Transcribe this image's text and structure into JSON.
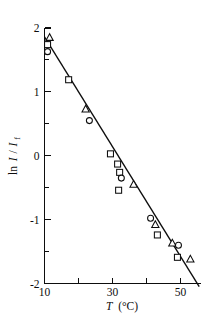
{
  "figure": {
    "background_color": "#ffffff",
    "ink_color": "#0d0d0d"
  },
  "chart_data": {
    "type": "scatter",
    "title": "",
    "subtitle": "",
    "xlabel": "T (°C)",
    "xlabel_parts": {
      "symbol": "T",
      "units": "(°C)"
    },
    "ylabel": "ln I / I_f",
    "ylabel_parts": {
      "prefix": "ln",
      "numerator": "I",
      "slash": "/",
      "denominator": "I",
      "denominator_subscript": "f"
    },
    "xlim": [
      10,
      56
    ],
    "ylim": [
      -2,
      2
    ],
    "xticks_major": [
      10,
      30,
      50
    ],
    "xticks_major_labels": [
      "10",
      "30",
      "50"
    ],
    "xticks_minor": [
      20,
      40
    ],
    "yticks_major": [
      2,
      1,
      0,
      -1,
      -2
    ],
    "yticks_major_labels": [
      "2",
      "1",
      "0",
      "-1",
      "-2"
    ],
    "yticks_minor": [
      1.5,
      0.5,
      -0.5,
      -1.5
    ],
    "grid": false,
    "legend": "none",
    "series": [
      {
        "name": "triangle",
        "marker": "triangle",
        "x": [
          11.5,
          22.1,
          36.2,
          42.6,
          47.6,
          52.9
        ],
        "y": [
          1.85,
          0.73,
          -0.45,
          -1.08,
          -1.37,
          -1.62
        ]
      },
      {
        "name": "square",
        "marker": "square",
        "x": [
          10.9,
          17.1,
          29.4,
          31.5,
          32.1,
          31.8,
          43.2,
          49.1
        ],
        "y": [
          1.74,
          1.19,
          0.03,
          -0.13,
          -0.26,
          -0.54,
          -1.24,
          -1.59
        ]
      },
      {
        "name": "circle",
        "marker": "circle",
        "x": [
          10.9,
          23.2,
          32.6,
          41.2,
          49.4
        ],
        "y": [
          1.63,
          0.55,
          -0.35,
          -0.98,
          -1.4
        ]
      }
    ],
    "fit_line": {
      "name": "linear-fit",
      "x": [
        10.0,
        55.5
      ],
      "y": [
        1.86,
        -2.05
      ]
    }
  }
}
